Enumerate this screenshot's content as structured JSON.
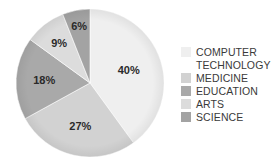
{
  "chart_data": {
    "type": "pie",
    "title": "",
    "categories": [
      "COMPUTER TECHNOLOGY",
      "MEDICINE",
      "EDUCATION",
      "ARTS",
      "SCIENCE"
    ],
    "values": [
      40,
      27,
      18,
      9,
      6
    ],
    "labels": [
      "40%",
      "27%",
      "18%",
      "9%",
      "6%"
    ],
    "colors": [
      "#efefef",
      "#d2d2d2",
      "#a9a9a9",
      "#dcdcdc",
      "#a3a3a3"
    ],
    "start_angle": "12 o'clock",
    "direction": "clockwise",
    "legend_position": "right"
  },
  "legend": {
    "items": [
      {
        "label": "COMPUTER\nTECHNOLOGY",
        "color": "#efefef"
      },
      {
        "label": "MEDICINE",
        "color": "#d2d2d2"
      },
      {
        "label": "EDUCATION",
        "color": "#a9a9a9"
      },
      {
        "label": "ARTS",
        "color": "#dcdcdc"
      },
      {
        "label": "SCIENCE",
        "color": "#a3a3a3"
      }
    ]
  }
}
